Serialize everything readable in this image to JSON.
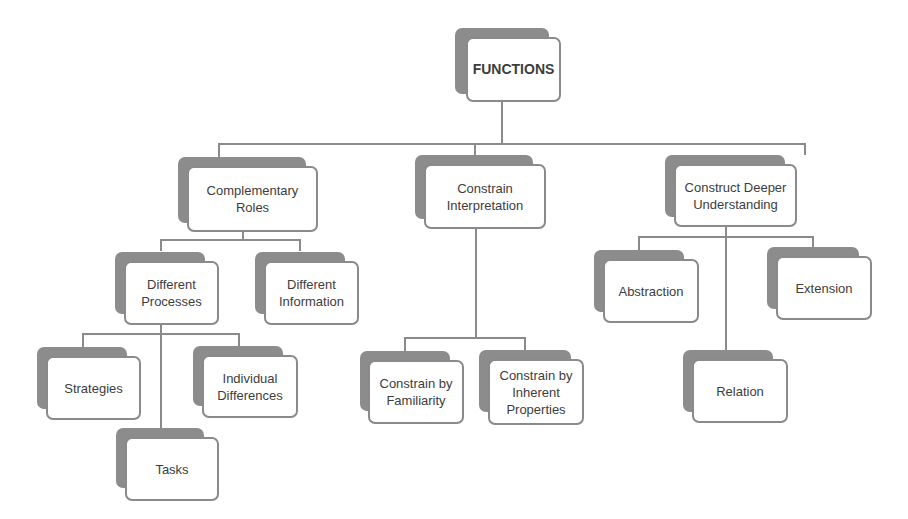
{
  "diagram": {
    "title": "FUNCTIONS",
    "colors": {
      "line": "#8a8a8a",
      "shadow": "#8c8c8c",
      "card_border": "#8a8a8a",
      "text": "#3d3d3d",
      "background": "#ffffff"
    },
    "root": {
      "label": "FUNCTIONS"
    },
    "level1": [
      {
        "label": "Complementary Roles"
      },
      {
        "label": "Constrain Interpretation"
      },
      {
        "label": "Construct Deeper Understanding"
      }
    ],
    "complementary_roles_children": [
      {
        "label": "Different Processes"
      },
      {
        "label": "Different Information"
      }
    ],
    "different_processes_children": [
      {
        "label": "Strategies"
      },
      {
        "label": "Individual Differences"
      },
      {
        "label": "Tasks"
      }
    ],
    "constrain_interpretation_children": [
      {
        "label": "Constrain by Familiarity"
      },
      {
        "label": "Constrain by Inherent Properties"
      }
    ],
    "construct_deeper_understanding_children": [
      {
        "label": "Abstraction"
      },
      {
        "label": "Extension"
      },
      {
        "label": "Relation"
      }
    ]
  }
}
